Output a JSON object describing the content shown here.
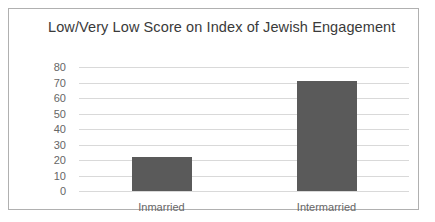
{
  "frame": {
    "border_color": "#b0b0b0",
    "background": "#ffffff"
  },
  "chart_data": {
    "type": "bar",
    "title": "Low/Very Low Score on Index of Jewish Engagement",
    "xlabel": "",
    "ylabel": "",
    "categories": [
      "Inmarried",
      "Intermarried"
    ],
    "values": [
      22,
      71
    ],
    "ylim": [
      0,
      80
    ],
    "ytick_labels": [
      "80",
      "70",
      "60",
      "50",
      "40",
      "30",
      "20",
      "10",
      "0"
    ],
    "ytick_values": [
      80,
      70,
      60,
      50,
      40,
      30,
      20,
      10,
      0
    ],
    "grid": true,
    "grid_color": "#d9d9d9",
    "legend": false,
    "legend_position": "none",
    "bar_color": "#5a5a5a",
    "title_color": "#3a3a3a",
    "tick_label_color": "#666666"
  }
}
